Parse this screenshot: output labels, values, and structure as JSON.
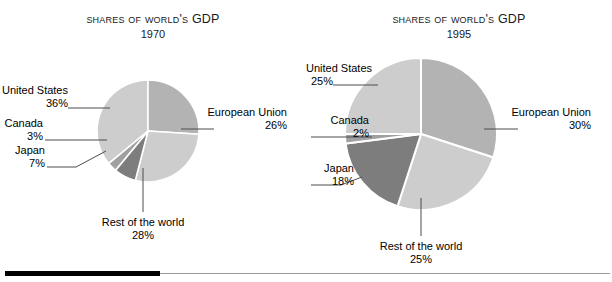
{
  "figure": {
    "rule_color": "#000000",
    "rule_gray_color": "#9a9a9a",
    "background": "#ffffff"
  },
  "palette": {
    "united_states": "#cdcdcd",
    "european_union": "#b3b3b3",
    "rest_of_the_world": "#cdcdcd",
    "japan": "#7d7d7d",
    "canada": "#a0a0a0",
    "slice_outline": "#ffffff",
    "leader_line": "#4d4d4d",
    "text": "#000000"
  },
  "charts": [
    {
      "title_part1": "Shares",
      "title_part2": "of",
      "title_part3": "World's",
      "title_part4": "GDP",
      "title_full": "SHARES OF WORLD'S GDP",
      "year": "1970",
      "labels": {
        "united_states_name": "United States",
        "united_states_pct": "36%",
        "canada_name": "Canada",
        "canada_pct": "3%",
        "japan_name": "Japan",
        "japan_pct": "7%",
        "rest_name": "Rest of the world",
        "rest_pct": "28%",
        "eu_name": "European Union",
        "eu_pct": "26%"
      }
    },
    {
      "title_part1": "Shares",
      "title_part2": "of",
      "title_part3": "World's",
      "title_part4": "GDP",
      "title_full": "SHARES OF WORLD'S GDP",
      "year": "1995",
      "labels": {
        "united_states_name": "United States",
        "united_states_pct": "25%",
        "canada_name": "Canada",
        "canada_pct": "2%",
        "japan_name": "Japan",
        "japan_pct": "18%",
        "rest_name": "Rest of the world",
        "rest_pct": "25%",
        "eu_name": "European Union",
        "eu_pct": "30%"
      }
    }
  ],
  "chart_data": [
    {
      "type": "pie",
      "title": "SHARES OF WORLD'S GDP",
      "subtitle": "1970",
      "xlabel": "",
      "ylabel": "",
      "legend_position": "callout-labels",
      "grid": false,
      "categories": [
        "United States",
        "European Union",
        "Rest of the world",
        "Japan",
        "Canada"
      ],
      "values": [
        36,
        26,
        28,
        7,
        3
      ],
      "unit": "percent",
      "colors": [
        "#cdcdcd",
        "#b3b3b3",
        "#cdcdcd",
        "#7d7d7d",
        "#a0a0a0"
      ],
      "annotations": [
        "36%",
        "26%",
        "28%",
        "7%",
        "3%"
      ]
    },
    {
      "type": "pie",
      "title": "SHARES OF WORLD'S GDP",
      "subtitle": "1995",
      "xlabel": "",
      "ylabel": "",
      "legend_position": "callout-labels",
      "grid": false,
      "categories": [
        "United States",
        "European Union",
        "Rest of the world",
        "Japan",
        "Canada"
      ],
      "values": [
        25,
        30,
        25,
        18,
        2
      ],
      "unit": "percent",
      "colors": [
        "#cdcdcd",
        "#b3b3b3",
        "#cdcdcd",
        "#7d7d7d",
        "#a0a0a0"
      ],
      "annotations": [
        "25%",
        "30%",
        "25%",
        "18%",
        "2%"
      ]
    }
  ]
}
